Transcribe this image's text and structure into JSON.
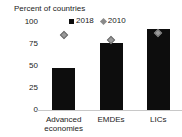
{
  "chart_data": {
    "type": "bar",
    "title": "Percent of countries",
    "xlabel": "",
    "ylabel": "Percent of countries",
    "categories": [
      "Advanced economies",
      "EMDEs",
      "LICs"
    ],
    "category_lines": [
      [
        "Advanced",
        "economies"
      ],
      [
        "EMDEs"
      ],
      [
        "LICs"
      ]
    ],
    "series": [
      {
        "name": "2018",
        "type": "bar",
        "color": "#0d0d0d",
        "values": [
          48,
          76,
          92
        ]
      },
      {
        "name": "2010",
        "type": "marker",
        "marker": "diamond",
        "color": "#9a9a9a",
        "values": [
          85,
          79,
          87
        ]
      }
    ],
    "ylim": [
      0,
      100
    ],
    "yticks": [
      0,
      25,
      50,
      75,
      100
    ],
    "ytick_labels": [
      "0",
      "25",
      "50",
      "75",
      "100"
    ],
    "grid": false,
    "legend_position": "top-right",
    "legend": [
      {
        "label": "2018",
        "marker": "square",
        "color": "#0d0d0d"
      },
      {
        "label": "2010",
        "marker": "diamond",
        "color": "#8a8a8a"
      }
    ]
  }
}
